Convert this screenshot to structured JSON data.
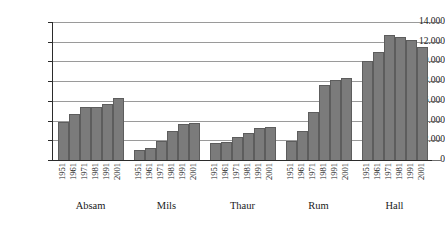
{
  "chart_data": {
    "type": "bar",
    "title": "",
    "subtitle": "",
    "xlabel": "",
    "ylabel": "",
    "ylim": [
      0,
      14000
    ],
    "ytick_values": [
      0,
      2000,
      4000,
      6000,
      8000,
      10000,
      12000,
      14000
    ],
    "ytick_labels": [
      "0",
      "2.000",
      "4.000",
      "6.000",
      "8.000",
      "10.000",
      "12.000",
      "14.000"
    ],
    "grid": true,
    "legend": "none",
    "number_format": "european-dot-thousands",
    "categories": [
      "1951",
      "1961",
      "1971",
      "1981",
      "1991",
      "2001"
    ],
    "groups": [
      {
        "name": "Absam",
        "values": [
          3900,
          4650,
          5350,
          5400,
          5700,
          6300
        ]
      },
      {
        "name": "Mils",
        "values": [
          1000,
          1250,
          1950,
          2950,
          3650,
          3750
        ]
      },
      {
        "name": "Thaur",
        "values": [
          1700,
          1850,
          2350,
          2700,
          3200,
          3400
        ]
      },
      {
        "name": "Rum",
        "values": [
          1900,
          2900,
          4900,
          7600,
          8100,
          8300
        ]
      },
      {
        "name": "Hall",
        "values": [
          10050,
          11000,
          12700,
          12500,
          12200,
          11450
        ]
      }
    ],
    "colors": {
      "bar_fill": "#7b7b7b",
      "bar_border": "#5d5d5d",
      "gridline": "#9a9a9a",
      "axis": "#2b2b2b",
      "background": "#ffffff",
      "text": "#1a1a1a"
    }
  }
}
